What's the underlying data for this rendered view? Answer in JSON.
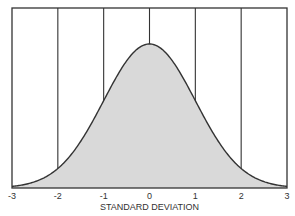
{
  "chart_data": {
    "type": "area",
    "title": "",
    "xlabel": "STANDARD DEVIATION",
    "ylabel": "",
    "categories": [
      "-3",
      "-2",
      "-1",
      "0",
      "1",
      "2",
      "3"
    ],
    "x": [
      -3,
      -2,
      -1,
      0,
      1,
      2,
      3
    ],
    "values": [
      0.011,
      0.135,
      0.607,
      1.0,
      0.607,
      0.135,
      0.011
    ],
    "xlim": [
      -3,
      3
    ],
    "ylim": [
      0,
      1.25
    ],
    "grid": {
      "vertical": true,
      "horizontal": false
    },
    "legend": null,
    "fill_color": "#d9d9d9",
    "line_color": "#333333"
  },
  "axis": {
    "ticks": [
      "-3",
      "-2",
      "-1",
      "0",
      "1",
      "2",
      "3"
    ],
    "label": "STANDARD DEVIATION"
  }
}
